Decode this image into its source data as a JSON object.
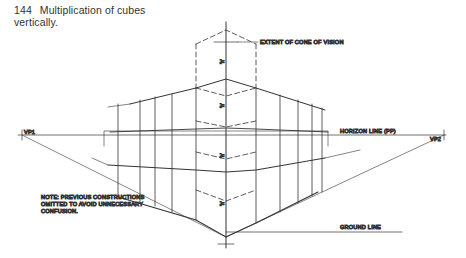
{
  "figure": {
    "number": "144",
    "title": "Multiplication of cubes vertically.",
    "title_line1": "Multiplication of cubes",
    "title_line2": "vertically."
  },
  "labels": {
    "cone_of_vision": "EXTENT OF CONE OF VISION",
    "horizon_line": "HORIZON LINE (PP)",
    "ground_line": "GROUND LINE",
    "vp1": "VP1",
    "vp2": "VP2",
    "note_line1": "NOTE: PREVIOUS CONSTRUCTIONS",
    "note_line2": "OMITTED TO AVOID UNNECESSARY",
    "note_line3": "CONFUSION.",
    "dimension_marks": [
      "'h'",
      "'h'",
      "'h'",
      "'h'"
    ]
  },
  "colors": {
    "ink": "#333333",
    "background": "#ffffff"
  }
}
